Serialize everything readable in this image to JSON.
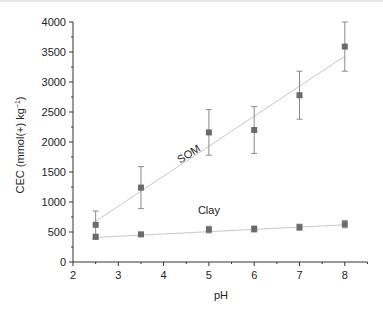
{
  "chart_data": {
    "type": "scatter",
    "title": "",
    "xlabel": "pH",
    "ylabel": "CEC (mmol(+) kg",
    "ylabel_sup": "−1",
    "ylabel_close": ")",
    "xlim": [
      2,
      8.5
    ],
    "ylim": [
      0,
      4000
    ],
    "xticks": [
      2,
      3,
      4,
      5,
      6,
      7,
      8
    ],
    "yticks": [
      0,
      500,
      1000,
      1500,
      2000,
      2500,
      3000,
      3500,
      4000
    ],
    "grid": false,
    "legend": "inline labels",
    "series": [
      {
        "name": "SOM",
        "x": [
          2.5,
          3.5,
          5,
          6,
          7,
          8
        ],
        "values": [
          620,
          1240,
          2160,
          2200,
          2780,
          3590
        ],
        "errors": [
          230,
          350,
          380,
          390,
          400,
          410
        ],
        "fit": {
          "x": [
            2.5,
            8
          ],
          "y": [
            680,
            3430
          ]
        },
        "label_pos": {
          "x": 4.6,
          "y": 1750,
          "rotate": -33
        }
      },
      {
        "name": "Clay",
        "x": [
          2.5,
          3.5,
          5,
          6,
          7,
          8
        ],
        "values": [
          420,
          460,
          540,
          550,
          580,
          630
        ],
        "errors": [
          40,
          35,
          55,
          50,
          50,
          60
        ],
        "fit": {
          "x": [
            2.5,
            8
          ],
          "y": [
            410,
            620
          ]
        },
        "label_pos": {
          "x": 5,
          "y": 800,
          "rotate": 0
        }
      }
    ],
    "colors": {
      "marker": "#6b6b6b",
      "fit_line": "#c8c8c8",
      "error_bar": "#8a8a8a",
      "axis": "#333333"
    }
  }
}
